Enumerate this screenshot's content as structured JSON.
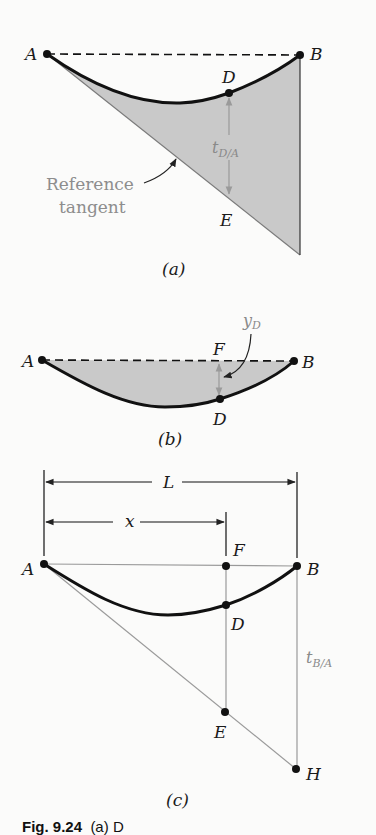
{
  "figure": {
    "caption_label": "Fig. 9.24",
    "caption_text": "(a) D",
    "colors": {
      "ink": "#111111",
      "gray_line": "#9a9a9a",
      "gray_text": "#8a8a8a",
      "fill": "#c9c9c9",
      "background": "#fbfbfa"
    }
  },
  "panel_a": {
    "label": "(a)",
    "points": {
      "A": "A",
      "B": "B",
      "D": "D",
      "E": "E"
    },
    "deflection_label_main": "t",
    "deflection_label_sub": "D/A",
    "reference_line1": "Reference",
    "reference_line2": "tangent"
  },
  "panel_b": {
    "label": "(b)",
    "points": {
      "A": "A",
      "B": "B",
      "D": "D",
      "F": "F"
    },
    "deflection_label_main": "y",
    "deflection_label_sub": "D"
  },
  "panel_c": {
    "label": "(c)",
    "points": {
      "A": "A",
      "B": "B",
      "D": "D",
      "E": "E",
      "F": "F",
      "H": "H"
    },
    "span_label": "L",
    "distance_label": "x",
    "deviation_label_main": "t",
    "deviation_label_sub": "B/A"
  }
}
